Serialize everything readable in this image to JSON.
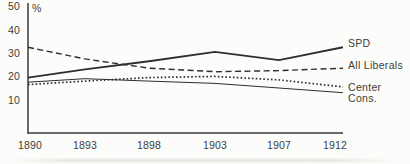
{
  "chart_data": {
    "type": "line",
    "title": "",
    "xlabel": "",
    "ylabel": "%",
    "categories": [
      "1890",
      "1893",
      "1898",
      "1903",
      "1907",
      "1912"
    ],
    "yticks": [
      50,
      40,
      30,
      20,
      10
    ],
    "ylim": [
      0,
      52
    ],
    "grid": false,
    "legend_position": "right-of-line-ends",
    "line_color": "#2e2e2e",
    "axis_color": "#3a3a3a",
    "text_color": "#3c3c3c",
    "series": [
      {
        "name": "SPD",
        "style": "solid-thick",
        "values": [
          19.5,
          23,
          26.5,
          30.5,
          27,
          32.5
        ]
      },
      {
        "name": "All Liberals",
        "style": "dashed",
        "values": [
          32.5,
          27.5,
          23.5,
          22,
          22.5,
          23.5
        ]
      },
      {
        "name": "Center",
        "style": "dotted",
        "values": [
          16.5,
          18,
          19.5,
          20,
          18.5,
          15.5
        ]
      },
      {
        "name": "Cons.",
        "style": "solid-thin",
        "values": [
          17.5,
          19,
          18,
          17,
          15,
          13
        ]
      }
    ]
  }
}
